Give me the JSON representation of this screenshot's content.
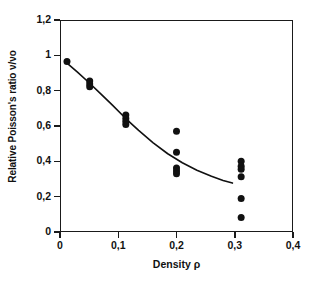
{
  "chart_data": {
    "type": "scatter",
    "title": "",
    "xlabel": "Density ρ",
    "ylabel": "Relative Poisson's ratio ν/νo",
    "xlim": [
      0,
      0.4
    ],
    "ylim": [
      0,
      1.2
    ],
    "grid": false,
    "legend": false,
    "x_tick_labels": [
      "0",
      "0,1",
      "0,2",
      "0,3",
      "0,4"
    ],
    "x_tick_values": [
      0,
      0.1,
      0.2,
      0.3,
      0.4
    ],
    "y_tick_labels": [
      "0",
      "0,2",
      "0,4",
      "0,6",
      "0,8",
      "1",
      "1,2"
    ],
    "y_tick_values": [
      0,
      0.2,
      0.4,
      0.6,
      0.8,
      1.0,
      1.2
    ],
    "decimal_separator": "comma",
    "marker": {
      "shape": "circle",
      "color": "#111111",
      "size_px": 7
    },
    "series": [
      {
        "name": "measurements",
        "type": "scatter",
        "points": [
          {
            "x": 0.012,
            "y": 0.965
          },
          {
            "x": 0.051,
            "y": 0.855
          },
          {
            "x": 0.051,
            "y": 0.838
          },
          {
            "x": 0.051,
            "y": 0.822
          },
          {
            "x": 0.113,
            "y": 0.662
          },
          {
            "x": 0.113,
            "y": 0.643
          },
          {
            "x": 0.113,
            "y": 0.625
          },
          {
            "x": 0.113,
            "y": 0.608
          },
          {
            "x": 0.2,
            "y": 0.57
          },
          {
            "x": 0.2,
            "y": 0.452
          },
          {
            "x": 0.2,
            "y": 0.362
          },
          {
            "x": 0.2,
            "y": 0.345
          },
          {
            "x": 0.2,
            "y": 0.33
          },
          {
            "x": 0.311,
            "y": 0.4
          },
          {
            "x": 0.311,
            "y": 0.372
          },
          {
            "x": 0.311,
            "y": 0.355
          },
          {
            "x": 0.311,
            "y": 0.313
          },
          {
            "x": 0.311,
            "y": 0.19
          },
          {
            "x": 0.311,
            "y": 0.082
          }
        ]
      },
      {
        "name": "fitted-curve",
        "type": "line",
        "color": "#111111",
        "points": [
          {
            "x": 0.014,
            "y": 0.95
          },
          {
            "x": 0.03,
            "y": 0.905
          },
          {
            "x": 0.05,
            "y": 0.845
          },
          {
            "x": 0.07,
            "y": 0.782
          },
          {
            "x": 0.09,
            "y": 0.718
          },
          {
            "x": 0.112,
            "y": 0.645
          },
          {
            "x": 0.135,
            "y": 0.575
          },
          {
            "x": 0.16,
            "y": 0.505
          },
          {
            "x": 0.185,
            "y": 0.443
          },
          {
            "x": 0.21,
            "y": 0.392
          },
          {
            "x": 0.235,
            "y": 0.35
          },
          {
            "x": 0.26,
            "y": 0.315
          },
          {
            "x": 0.28,
            "y": 0.292
          },
          {
            "x": 0.296,
            "y": 0.277
          }
        ]
      }
    ]
  }
}
